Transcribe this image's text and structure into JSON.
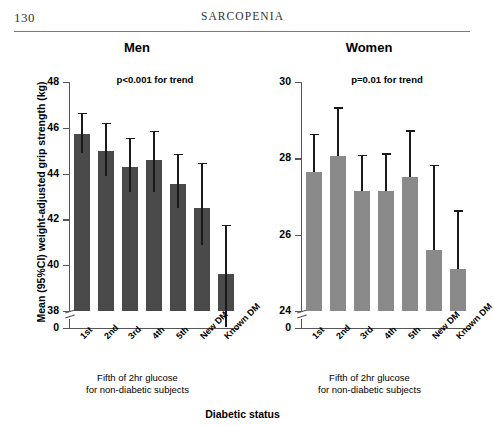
{
  "page": {
    "number": "130",
    "running_head": "SARCOPENIA"
  },
  "figure": {
    "y_axis_title": "Mean (95%CI) weight-adjusted grip strength (kg)",
    "x_axis_title": "Diabetic status",
    "x_caption_line1": "Fifth of 2hr glucose",
    "x_caption_line2": "for non-diabetic subjects",
    "colors": {
      "men_bar": "#4a4a4a",
      "women_bar": "#8a8a8a",
      "axis": "#555555",
      "error_bar": "#1a1a1a"
    }
  },
  "chart_data": [
    {
      "type": "bar",
      "title": "Men",
      "annotation": "p<0.001 for trend",
      "xlabel": "Diabetic status",
      "ylabel": "Mean (95%CI) weight-adjusted grip strength (kg)",
      "categories": [
        "1st",
        "2nd",
        "3rd",
        "4th",
        "5th",
        "New DM",
        "Known DM"
      ],
      "values": [
        45.75,
        45.0,
        44.3,
        44.6,
        43.55,
        42.5,
        39.6
      ],
      "ci_low": [
        44.9,
        43.9,
        43.2,
        43.2,
        42.5,
        40.9,
        37.3
      ],
      "ci_high": [
        46.6,
        46.15,
        45.5,
        45.8,
        44.8,
        44.4,
        41.7
      ],
      "ylim": [
        38,
        48
      ],
      "yticks": [
        48,
        46,
        44,
        42,
        40,
        38,
        0
      ],
      "axis_break": true,
      "grid": false,
      "legend": "none",
      "bar_color": "#4a4a4a"
    },
    {
      "type": "bar",
      "title": "Women",
      "annotation": "p=0.01 for trend",
      "xlabel": "Diabetic status",
      "ylabel": "Mean (95%CI) weight-adjusted grip strength (kg)",
      "categories": [
        "1st",
        "2nd",
        "3rd",
        "4th",
        "5th",
        "New DM",
        "Known DM"
      ],
      "values": [
        27.65,
        28.05,
        27.15,
        27.15,
        27.5,
        25.6,
        25.1
      ],
      "ci_low": [
        27.65,
        28.05,
        27.15,
        27.15,
        27.5,
        25.6,
        25.1
      ],
      "ci_high": [
        28.6,
        29.3,
        28.05,
        28.1,
        28.7,
        27.8,
        26.6
      ],
      "ylim": [
        24,
        30
      ],
      "yticks": [
        30,
        28,
        26,
        24,
        0
      ],
      "axis_break": true,
      "grid": false,
      "legend": "none",
      "bar_color": "#8a8a8a"
    }
  ]
}
